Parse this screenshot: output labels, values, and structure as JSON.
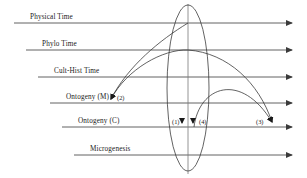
{
  "figure": {
    "width": 307,
    "height": 178,
    "background": "#ffffff",
    "line_color": "#3b3b3b",
    "text_color": "#1a1a1a",
    "timelines": [
      {
        "label": "Physical Time",
        "y": 23,
        "x_start": 14,
        "x_end": 292,
        "label_x": 30,
        "label_y": 13
      },
      {
        "label": "Phylo Time",
        "y": 50,
        "x_start": 26,
        "x_end": 292,
        "label_x": 42,
        "label_y": 40
      },
      {
        "label": "Cult-Hist Time",
        "y": 77,
        "x_start": 38,
        "x_end": 292,
        "label_x": 54,
        "label_y": 67
      },
      {
        "label": "Ontogeny (M)",
        "y": 103,
        "x_start": 50,
        "x_end": 292,
        "label_x": 66,
        "label_y": 93
      },
      {
        "label": "Ontogeny (C)",
        "y": 127,
        "x_start": 62,
        "x_end": 292,
        "label_x": 78,
        "label_y": 117
      },
      {
        "label": "Microgenesis",
        "y": 155,
        "x_start": 74,
        "x_end": 292,
        "label_x": 90,
        "label_y": 145
      }
    ],
    "markers": [
      {
        "name": "(1)",
        "x": 172,
        "y": 124,
        "arrow_x": 182,
        "arrow_y": 127
      },
      {
        "name": "(2)",
        "x": 117,
        "y": 100,
        "arrow_x": 110,
        "arrow_y": 103
      },
      {
        "name": "(4)",
        "x": 199,
        "y": 124,
        "arrow_x": 193,
        "arrow_y": 127
      },
      {
        "name": "(3)",
        "x": 258,
        "y": 124,
        "arrow_x": 272,
        "arrow_y": 127
      }
    ],
    "ellipse": {
      "cx": 188,
      "cy": 88,
      "rx": 21,
      "ry": 83
    },
    "axis_vertical": {
      "x": 188,
      "y_top": 4,
      "y_bottom": 174
    },
    "arcs": [
      {
        "name": "arc-center-to-ontogeny-m-outer",
        "path": "M 188 23 C 160 40, 128 66, 110 101"
      },
      {
        "name": "arc-center-to-ontogeny-m-inner",
        "path": "M 188 50 C 162 50, 126 70, 110 101"
      },
      {
        "name": "arc-center-to-ontogeny-c-right-outer",
        "path": "M 188 50 C 226 52, 258 82, 272 125"
      },
      {
        "name": "arc-center-to-ontogeny-c-right-inner",
        "path": "M 193 127 C 200 88, 240 72, 272 125"
      }
    ]
  }
}
